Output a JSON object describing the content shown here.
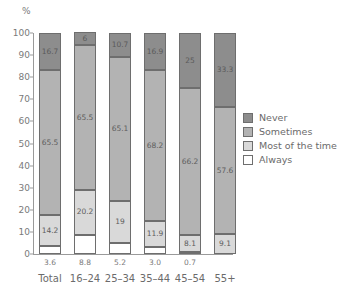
{
  "chart_data": {
    "type": "bar",
    "stacked": true,
    "title": "",
    "subtitle": "",
    "xlabel": "",
    "ylabel": "%",
    "ylim": [
      0,
      100
    ],
    "yticks": [
      0,
      10,
      20,
      30,
      40,
      50,
      60,
      70,
      80,
      90,
      100
    ],
    "grid": false,
    "legend_position": "right",
    "categories": [
      "Total",
      "16–24",
      "25–34",
      "35–44",
      "45–54",
      "55+"
    ],
    "series": [
      {
        "name": "Always",
        "color": "#ffffff",
        "values": [
          3.6,
          8.8,
          5.2,
          3.0,
          0.7,
          0
        ]
      },
      {
        "name": "Most of the time",
        "color": "#d9d9d9",
        "values": [
          14.2,
          20.2,
          19,
          11.9,
          8.1,
          9.1
        ]
      },
      {
        "name": "Sometimes",
        "color": "#b3b3b3",
        "values": [
          65.5,
          65.5,
          65.1,
          68.2,
          66.2,
          57.6
        ]
      },
      {
        "name": "Never",
        "color": "#8d8d8d",
        "values": [
          16.7,
          6,
          10.7,
          16.9,
          25,
          33.3
        ]
      }
    ],
    "segment_labels": [
      {
        "category": "Total",
        "Never": "16.7",
        "Sometimes": "65.5",
        "Most of the time": "14.2",
        "Always": ""
      },
      {
        "category": "16–24",
        "Never": "6",
        "Sometimes": "65.5",
        "Most of the time": "20.2",
        "Always": ""
      },
      {
        "category": "25–34",
        "Never": "10.7",
        "Sometimes": "65.1",
        "Most of the time": "19",
        "Always": ""
      },
      {
        "category": "35–44",
        "Never": "16.9",
        "Sometimes": "68.2",
        "Most of the time": "11.9",
        "Always": ""
      },
      {
        "category": "45–54",
        "Never": "25",
        "Sometimes": "66.2",
        "Most of the time": "8.1",
        "Always": ""
      },
      {
        "category": "55+",
        "Never": "33.3",
        "Sometimes": "57.6",
        "Most of the time": "9.1",
        "Always": ""
      }
    ],
    "below_axis_values": [
      "3.6",
      "8.8",
      "5.2",
      "3.0",
      "0.7",
      ""
    ],
    "legend": [
      "Never",
      "Sometimes",
      "Most of the time",
      "Always"
    ]
  },
  "axis": {
    "y_unit": "%",
    "ticks": [
      "100",
      "90",
      "80",
      "70",
      "60",
      "50",
      "40",
      "30",
      "20",
      "10",
      "0"
    ]
  },
  "legend": {
    "items": [
      {
        "label": "Never",
        "color": "#8d8d8d"
      },
      {
        "label": "Sometimes",
        "color": "#b3b3b3"
      },
      {
        "label": "Most of the time",
        "color": "#d9d9d9"
      },
      {
        "label": "Always",
        "color": "#ffffff"
      }
    ]
  }
}
